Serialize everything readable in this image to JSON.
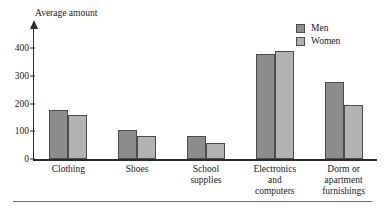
{
  "figure": {
    "clipped_caption": "",
    "bottom_rule": "horizontal-rule"
  },
  "chart_data": {
    "type": "bar",
    "title": "",
    "subtitle": "",
    "xlabel": "",
    "ylabel": "Average amount",
    "categories": [
      "Clothing",
      "Shoes",
      "School\nsupplies",
      "Electronics\nand\ncomputers",
      "Dorm or\napartment\nfurnishings"
    ],
    "series": [
      {
        "name": "Men",
        "color": "#8c8c8c",
        "values": [
          175,
          103,
          83,
          377,
          278
        ]
      },
      {
        "name": "Women",
        "color": "#b2b2b2",
        "values": [
          157,
          83,
          58,
          390,
          195
        ]
      }
    ],
    "ylim": [
      0,
      400
    ],
    "yticks": [
      0,
      100,
      200,
      300,
      400
    ],
    "ytick_labels": [
      "0",
      "100",
      "200",
      "300",
      "400"
    ],
    "grid": false,
    "legend_position": "top-right",
    "axis_color": "#2b2b2b",
    "y_axis_arrow": true
  }
}
